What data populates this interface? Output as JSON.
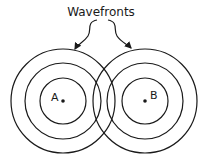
{
  "title": "Wavefronts",
  "sources": [
    {
      "label": "A",
      "cx": 63,
      "cy": 101
    },
    {
      "label": "B",
      "cx": 145,
      "cy": 101
    }
  ],
  "radii": [
    23,
    38,
    52
  ],
  "colors": {
    "stroke": "#1a1a1a",
    "background": "#ffffff"
  }
}
